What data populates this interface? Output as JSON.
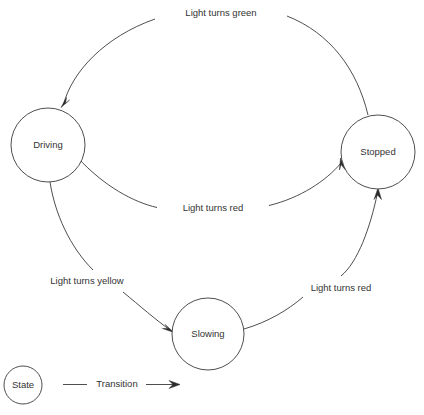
{
  "diagram": {
    "type": "state-diagram",
    "colors": {
      "stroke": "#3a3a3a",
      "text": "#333333",
      "background": "#ffffff",
      "arrow": "#2b2b2b"
    },
    "states": [
      {
        "id": "driving",
        "label": "Driving",
        "cx": 48,
        "cy": 145,
        "r": 37
      },
      {
        "id": "stopped",
        "label": "Stopped",
        "cx": 378,
        "cy": 152,
        "r": 37
      },
      {
        "id": "slowing",
        "label": "Slowing",
        "cx": 208,
        "cy": 334,
        "r": 36
      }
    ],
    "transitions": [
      {
        "id": "stopped-to-driving",
        "from": "Stopped",
        "to": "Driving",
        "label": "Light turns green",
        "label_x": 221,
        "label_y": 13
      },
      {
        "id": "driving-to-stopped",
        "from": "Driving",
        "to": "Stopped",
        "label": "Light turns red",
        "label_x": 213,
        "label_y": 208
      },
      {
        "id": "driving-to-slowing",
        "from": "Driving",
        "to": "Slowing",
        "label": "Light turns yellow",
        "label_x": 87,
        "label_y": 281
      },
      {
        "id": "slowing-to-stopped",
        "from": "Slowing",
        "to": "Stopped",
        "label": "Light turns red",
        "label_x": 341,
        "label_y": 288
      }
    ],
    "legend": {
      "state_label": "State",
      "state_cx": 23,
      "state_cy": 385,
      "state_r": 19,
      "transition_label": "Transition",
      "transition_label_x": 117,
      "transition_label_y": 384
    }
  }
}
